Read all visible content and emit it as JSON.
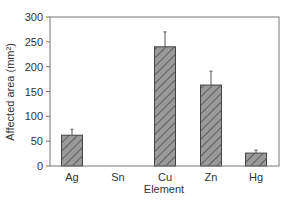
{
  "chart_data": {
    "type": "bar",
    "title": "",
    "xlabel": "Element",
    "ylabel": "Affected area (mm²)",
    "categories": [
      "Ag",
      "Sn",
      "Cu",
      "Zn",
      "Hg"
    ],
    "values": [
      62,
      0,
      240,
      163,
      26
    ],
    "error_upper": [
      74,
      null,
      270,
      191,
      32
    ],
    "ylim": [
      0,
      300
    ],
    "yticks": [
      0,
      50,
      100,
      150,
      200,
      250,
      300
    ],
    "grid": false,
    "legend": null,
    "bar_style": {
      "fill": "#9a9a9a",
      "hatch": "diagonal",
      "edge": "#444444"
    }
  }
}
